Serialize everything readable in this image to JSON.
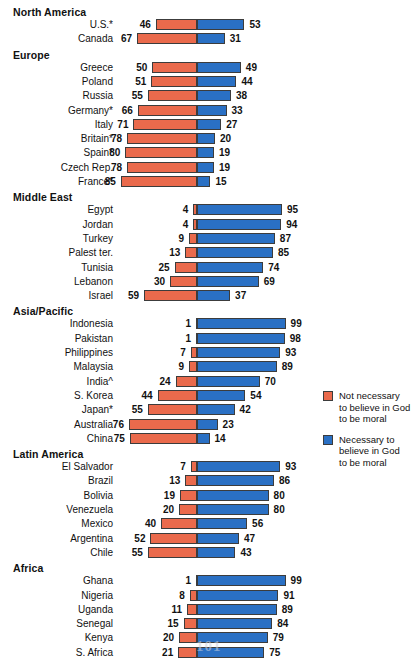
{
  "chart_data": {
    "type": "bar",
    "title": "",
    "subtitle": "",
    "xlabel": "",
    "ylabel": "",
    "orientation": "horizontal",
    "style": "diverging-stacked",
    "xlim": [
      100,
      100
    ],
    "grid": false,
    "legend_position": "right",
    "axis_note": "Percentages diverge from a shared center baseline; red extends left, blue extends right.",
    "series": [
      {
        "name": "Not necessary to believe in God to be moral",
        "color": "#ea6a4c",
        "direction": "left"
      },
      {
        "name": "Necessary to believe in God to be moral",
        "color": "#2a70c4",
        "direction": "right"
      }
    ],
    "categories": [
      "U.S.*",
      "Canada",
      "Greece",
      "Poland",
      "Russia",
      "Germany*",
      "Italy",
      "Britain*",
      "Spain*",
      "Czech Rep.",
      "France*",
      "Egypt",
      "Jordan",
      "Turkey",
      "Palest ter.",
      "Tunisia",
      "Lebanon",
      "Israel",
      "Indonesia",
      "Pakistan",
      "Philippines",
      "Malaysia",
      "India^",
      "S. Korea",
      "Japan*",
      "Australia",
      "China",
      "El Salvador",
      "Brazil",
      "Bolivia",
      "Venezuela",
      "Mexico",
      "Argentina",
      "Chile",
      "Ghana",
      "Nigeria",
      "Uganda",
      "Senegal",
      "Kenya",
      "S. Africa"
    ],
    "values_not_necessary": [
      46,
      67,
      50,
      51,
      55,
      66,
      71,
      78,
      80,
      78,
      85,
      4,
      4,
      9,
      13,
      25,
      30,
      59,
      1,
      1,
      7,
      9,
      24,
      44,
      55,
      76,
      75,
      7,
      13,
      19,
      20,
      40,
      52,
      55,
      1,
      8,
      11,
      15,
      20,
      21
    ],
    "values_necessary": [
      53,
      31,
      49,
      44,
      38,
      33,
      27,
      20,
      19,
      19,
      15,
      95,
      94,
      87,
      85,
      74,
      69,
      37,
      99,
      98,
      93,
      89,
      70,
      54,
      42,
      23,
      14,
      93,
      86,
      80,
      80,
      56,
      47,
      43,
      99,
      91,
      89,
      84,
      79,
      75
    ],
    "regions": [
      {
        "name": "North America",
        "rows": [
          {
            "country": "U.S.*",
            "left": 46,
            "right": 53
          },
          {
            "country": "Canada",
            "left": 67,
            "right": 31
          }
        ]
      },
      {
        "name": "Europe",
        "rows": [
          {
            "country": "Greece",
            "left": 50,
            "right": 49
          },
          {
            "country": "Poland",
            "left": 51,
            "right": 44
          },
          {
            "country": "Russia",
            "left": 55,
            "right": 38
          },
          {
            "country": "Germany*",
            "left": 66,
            "right": 33
          },
          {
            "country": "Italy",
            "left": 71,
            "right": 27
          },
          {
            "country": "Britain*",
            "left": 78,
            "right": 20
          },
          {
            "country": "Spain*",
            "left": 80,
            "right": 19
          },
          {
            "country": "Czech Rep.",
            "left": 78,
            "right": 19
          },
          {
            "country": "France*",
            "left": 85,
            "right": 15
          }
        ]
      },
      {
        "name": "Middle East",
        "rows": [
          {
            "country": "Egypt",
            "left": 4,
            "right": 95
          },
          {
            "country": "Jordan",
            "left": 4,
            "right": 94
          },
          {
            "country": "Turkey",
            "left": 9,
            "right": 87
          },
          {
            "country": "Palest ter.",
            "left": 13,
            "right": 85
          },
          {
            "country": "Tunisia",
            "left": 25,
            "right": 74
          },
          {
            "country": "Lebanon",
            "left": 30,
            "right": 69
          },
          {
            "country": "Israel",
            "left": 59,
            "right": 37
          }
        ]
      },
      {
        "name": "Asia/Pacific",
        "rows": [
          {
            "country": "Indonesia",
            "left": 1,
            "right": 99
          },
          {
            "country": "Pakistan",
            "left": 1,
            "right": 98
          },
          {
            "country": "Philippines",
            "left": 7,
            "right": 93
          },
          {
            "country": "Malaysia",
            "left": 9,
            "right": 89
          },
          {
            "country": "India^",
            "left": 24,
            "right": 70
          },
          {
            "country": "S. Korea",
            "left": 44,
            "right": 54
          },
          {
            "country": "Japan*",
            "left": 55,
            "right": 42
          },
          {
            "country": "Australia",
            "left": 76,
            "right": 23
          },
          {
            "country": "China",
            "left": 75,
            "right": 14
          }
        ]
      },
      {
        "name": "Latin America",
        "rows": [
          {
            "country": "El Salvador",
            "left": 7,
            "right": 93
          },
          {
            "country": "Brazil",
            "left": 13,
            "right": 86
          },
          {
            "country": "Bolivia",
            "left": 19,
            "right": 80
          },
          {
            "country": "Venezuela",
            "left": 20,
            "right": 80
          },
          {
            "country": "Mexico",
            "left": 40,
            "right": 56
          },
          {
            "country": "Argentina",
            "left": 52,
            "right": 47
          },
          {
            "country": "Chile",
            "left": 55,
            "right": 43
          }
        ]
      },
      {
        "name": "Africa",
        "rows": [
          {
            "country": "Ghana",
            "left": 1,
            "right": 99
          },
          {
            "country": "Nigeria",
            "left": 8,
            "right": 91
          },
          {
            "country": "Uganda",
            "left": 11,
            "right": 89
          },
          {
            "country": "Senegal",
            "left": 15,
            "right": 84
          },
          {
            "country": "Kenya",
            "left": 20,
            "right": 79
          },
          {
            "country": "S. Africa",
            "left": 21,
            "right": 75
          }
        ]
      }
    ]
  },
  "legend": {
    "items": [
      {
        "color": "#ea6a4c",
        "lines": [
          "Not necessary",
          "to believe in God",
          "to be moral"
        ]
      },
      {
        "color": "#2a70c4",
        "lines": [
          "Necessary to",
          "believe in God",
          "to be moral"
        ]
      }
    ]
  },
  "page_artifact": {
    "text": "101"
  }
}
